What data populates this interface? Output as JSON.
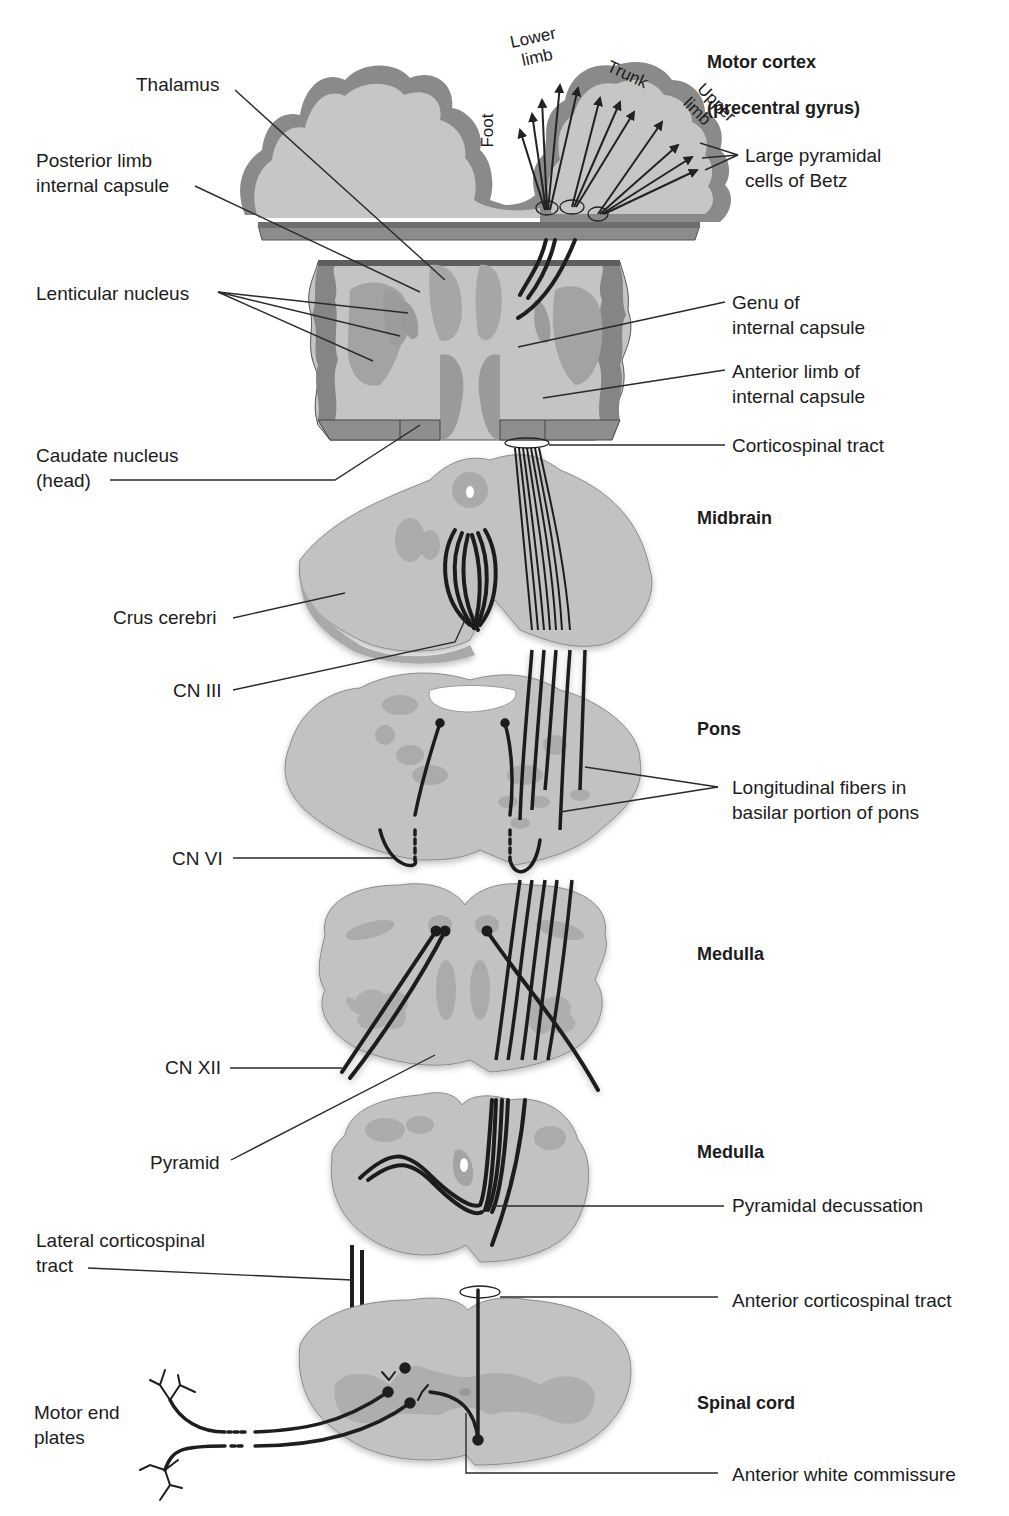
{
  "figure": {
    "colors": {
      "background": "#ffffff",
      "tissue_light": "#c9c9c9",
      "tissue_mid": "#a9a9a9",
      "cortex_gray": "#8a8a8a",
      "slab_edge": "#777777",
      "nucleus": "#a6a6a6",
      "fiber": "#222222",
      "leader_line": "#333333"
    }
  },
  "levels": [
    {
      "id": "motor-cortex",
      "title": "Motor cortex",
      "subtitle": "(precentral gyrus)"
    },
    {
      "id": "internal-capsule",
      "title": ""
    },
    {
      "id": "midbrain",
      "title": "Midbrain"
    },
    {
      "id": "pons",
      "title": "Pons"
    },
    {
      "id": "medulla-upper",
      "title": "Medulla"
    },
    {
      "id": "medulla-lower",
      "title": "Medulla"
    },
    {
      "id": "spinal-cord",
      "title": "Spinal cord"
    }
  ],
  "somatotopy": {
    "foot": "Foot",
    "lower_limb": "Lower\nlimb",
    "trunk": "Trunk",
    "upper_limb": "Upper\nlimb"
  },
  "labels_left": {
    "thalamus": "Thalamus",
    "posterior_limb": "Posterior limb\ninternal capsule",
    "lenticular_nucleus": "Lenticular nucleus",
    "caudate_nucleus": "Caudate nucleus\n(head)",
    "crus_cerebri": "Crus cerebri",
    "cn_iii": "CN III",
    "cn_vi": "CN VI",
    "cn_xii": "CN XII",
    "pyramid": "Pyramid",
    "lateral_cst": "Lateral corticospinal\ntract",
    "motor_end_plates": "Motor end\nplates"
  },
  "labels_right": {
    "betz": "Large pyramidal\ncells of Betz",
    "genu": "Genu of\ninternal capsule",
    "anterior_limb": "Anterior limb of\ninternal capsule",
    "corticospinal_tract": "Corticospinal tract",
    "longitudinal_fibers": "Longitudinal fibers in\nbasilar portion of pons",
    "pyramidal_decussation": "Pyramidal decussation",
    "anterior_cst": "Anterior corticospinal tract",
    "anterior_white_commissure": "Anterior white commissure"
  }
}
